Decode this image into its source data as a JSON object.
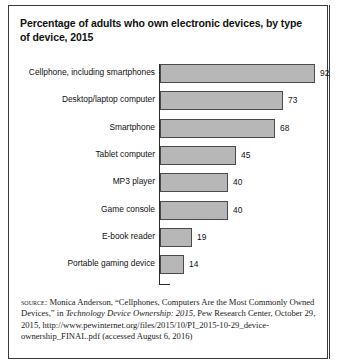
{
  "figure": {
    "title": "Percentage of adults who own electronic devices, by type of device, 2015",
    "source_kicker": "source:",
    "source_body_1": " Monica Anderson, “Cellphones, Computers Are the Most Commonly Owned Devices,” in ",
    "source_italic": "Technology Device Ownership: 2015",
    "source_body_2": ", Pew Research Center, October 29, 2015, http://www.pewinternet.org/files/2015/10/PI_2015-10-29_device-ownership_FINAL.pdf (accessed August 6, 2016)"
  },
  "colors": {
    "bar_fill": "#b7b7b7",
    "bar_stroke": "#4a4a4a",
    "axis": "#2b2b2b",
    "frame": "#3a3a3a",
    "text": "#111111"
  },
  "chart_data": {
    "type": "bar",
    "orientation": "horizontal",
    "title": "Percentage of adults who own electronic devices, by type of device, 2015",
    "xlabel": "",
    "ylabel": "",
    "xlim": [
      0,
      100
    ],
    "grid": false,
    "legend": "none",
    "data_labels": true,
    "categories": [
      "Cellphone, including smartphones",
      "Desktop/laptop computer",
      "Smartphone",
      "Tablet computer",
      "MP3 player",
      "Game console",
      "E-book reader",
      "Portable gaming device"
    ],
    "values": [
      92,
      73,
      68,
      45,
      40,
      40,
      19,
      14
    ],
    "value_labels": [
      "92",
      "73",
      "68",
      "45",
      "40",
      "40",
      "19",
      "14"
    ]
  }
}
